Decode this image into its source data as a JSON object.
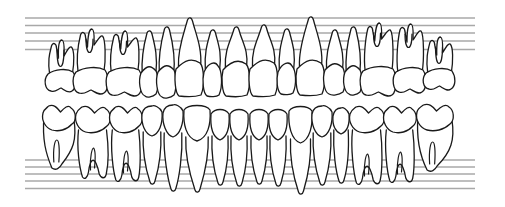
{
  "diagram": {
    "title": "",
    "type": "dental-chart",
    "colors": {
      "background": "#ffffff",
      "outline": "#1a1a1a",
      "gridline": "#a8a8a8"
    },
    "gridlines": {
      "upper_count": 5,
      "lower_count": 5
    },
    "upper_arch": {
      "teeth": [
        {
          "position": 1,
          "type": "molar",
          "roots": 3,
          "split": "narrow"
        },
        {
          "position": 2,
          "type": "molar",
          "roots": 3,
          "split": "wide"
        },
        {
          "position": 3,
          "type": "molar",
          "roots": 3,
          "split": "wide"
        },
        {
          "position": 4,
          "type": "premolar",
          "roots": 1,
          "split": "none"
        },
        {
          "position": 5,
          "type": "premolar",
          "roots": 1,
          "split": "none"
        },
        {
          "position": 6,
          "type": "canine",
          "roots": 1,
          "split": "none"
        },
        {
          "position": 7,
          "type": "lateral-incisor",
          "roots": 1,
          "split": "none"
        },
        {
          "position": 8,
          "type": "central-incisor",
          "roots": 1,
          "split": "none"
        },
        {
          "position": 9,
          "type": "central-incisor",
          "roots": 1,
          "split": "none"
        },
        {
          "position": 10,
          "type": "lateral-incisor",
          "roots": 1,
          "split": "none"
        },
        {
          "position": 11,
          "type": "canine",
          "roots": 1,
          "split": "none"
        },
        {
          "position": 12,
          "type": "premolar",
          "roots": 1,
          "split": "none"
        },
        {
          "position": 13,
          "type": "premolar",
          "roots": 1,
          "split": "none"
        },
        {
          "position": 14,
          "type": "molar",
          "roots": 3,
          "split": "wide"
        },
        {
          "position": 15,
          "type": "molar",
          "roots": 3,
          "split": "wide"
        },
        {
          "position": 16,
          "type": "molar",
          "roots": 3,
          "split": "narrow"
        }
      ]
    },
    "lower_arch": {
      "teeth": [
        {
          "position": 32,
          "type": "molar",
          "roots": 2,
          "split": "narrow"
        },
        {
          "position": 31,
          "type": "molar",
          "roots": 2,
          "split": "wide"
        },
        {
          "position": 30,
          "type": "molar",
          "roots": 2,
          "split": "wide"
        },
        {
          "position": 29,
          "type": "premolar",
          "roots": 1,
          "split": "none"
        },
        {
          "position": 28,
          "type": "premolar",
          "roots": 1,
          "split": "none"
        },
        {
          "position": 27,
          "type": "canine",
          "roots": 1,
          "split": "none"
        },
        {
          "position": 26,
          "type": "lateral-incisor",
          "roots": 1,
          "split": "none"
        },
        {
          "position": 25,
          "type": "central-incisor",
          "roots": 1,
          "split": "none"
        },
        {
          "position": 24,
          "type": "central-incisor",
          "roots": 1,
          "split": "none"
        },
        {
          "position": 23,
          "type": "lateral-incisor",
          "roots": 1,
          "split": "none"
        },
        {
          "position": 22,
          "type": "canine",
          "roots": 1,
          "split": "none"
        },
        {
          "position": 21,
          "type": "premolar",
          "roots": 1,
          "split": "none"
        },
        {
          "position": 20,
          "type": "premolar",
          "roots": 1,
          "split": "none"
        },
        {
          "position": 19,
          "type": "molar",
          "roots": 2,
          "split": "wide"
        },
        {
          "position": 18,
          "type": "molar",
          "roots": 2,
          "split": "wide"
        },
        {
          "position": 17,
          "type": "molar",
          "roots": 2,
          "split": "narrow"
        }
      ]
    }
  }
}
